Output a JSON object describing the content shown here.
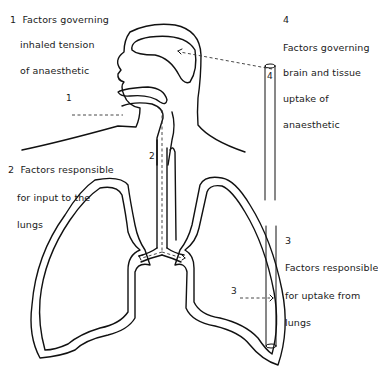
{
  "diagram": {
    "type": "anatomical-schematic",
    "labels": [
      {
        "id": "1",
        "number": "1",
        "lines": [
          "Factors governing",
          "inhaled tension",
          "of anaesthetic"
        ]
      },
      {
        "id": "2",
        "number": "2",
        "lines": [
          "Factors responsible",
          "for input to the",
          "lungs"
        ]
      },
      {
        "id": "3",
        "number": "3",
        "lines": [
          "Factors responsible",
          "for uptake from",
          "lungs"
        ]
      },
      {
        "id": "4",
        "number": "4",
        "lines": [
          "Factors governing",
          "brain and tissue",
          "uptake of",
          "anaesthetic"
        ]
      }
    ],
    "markers": {
      "mouth": "1",
      "trachea": "2",
      "lung_arrow": "3",
      "brain_tube": "4"
    }
  }
}
